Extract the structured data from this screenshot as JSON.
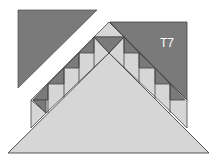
{
  "diagram": {
    "labels": {
      "right_piece": "T7"
    },
    "colors": {
      "dark": "#7a7a7a",
      "light": "#d6d6d6",
      "stroke": "#444444",
      "background": "#ffffff"
    }
  }
}
